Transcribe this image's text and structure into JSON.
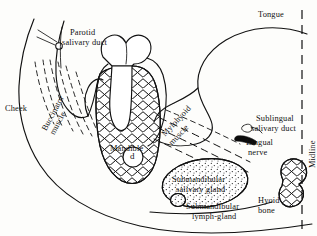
{
  "figure": {
    "orientation": "coronal section through mandible and floor of mouth",
    "line_color": "#111111",
    "background": "#fdfdfb"
  },
  "labels": {
    "cheek": "Cheek",
    "parotid_duct_line1": "Parotid",
    "parotid_duct_line2": "salivary duct",
    "buccinator_line1": "Buccinator",
    "buccinator_line2": "muscle",
    "mandible": "Mandible",
    "tooth_socket_letter": "d",
    "mylohyoid_line1": "Mylohyoid",
    "mylohyoid_line2": "muscle",
    "tongue": "Tongue",
    "sublingual_line1": "Sublingual",
    "sublingual_line2": "salivary duct",
    "lingual_line1": "Lingual",
    "lingual_line2": "nerve",
    "submandibular_gland_line1": "Submandibular",
    "submandibular_gland_line2": "salivary gland",
    "submandibular_lymph_line1": "Submandibular",
    "submandibular_lymph_line2": "lymph-gland",
    "hyoid_line1": "Hyoid",
    "hyoid_line2": "bone",
    "midline": "Midline"
  },
  "structures": [
    {
      "name": "cheek",
      "rendering": "outline-curve"
    },
    {
      "name": "parotid-salivary-duct",
      "rendering": "small-circle-with-radiating-lines"
    },
    {
      "name": "buccinator-muscle",
      "rendering": "dashed-fibre-lines"
    },
    {
      "name": "tooth",
      "rendering": "white-molar-crown-with-roots"
    },
    {
      "name": "mandible",
      "rendering": "cross-hatched-bone"
    },
    {
      "name": "inferior-alveolar-canal",
      "rendering": "small-circle-labelled-d"
    },
    {
      "name": "mylohyoid-muscle",
      "rendering": "dashed-fibre-band"
    },
    {
      "name": "tongue",
      "rendering": "outline-curve"
    },
    {
      "name": "sublingual-salivary-duct",
      "rendering": "small-open-tube"
    },
    {
      "name": "lingual-nerve",
      "rendering": "solid-black-cord"
    },
    {
      "name": "submandibular-salivary-gland",
      "rendering": "stippled-oval"
    },
    {
      "name": "submandibular-lymph-gland",
      "rendering": "small-stippled-oval"
    },
    {
      "name": "hyoid-bone",
      "rendering": "cross-hatched-bone"
    },
    {
      "name": "midline",
      "rendering": "vertical-dashed-line"
    }
  ]
}
